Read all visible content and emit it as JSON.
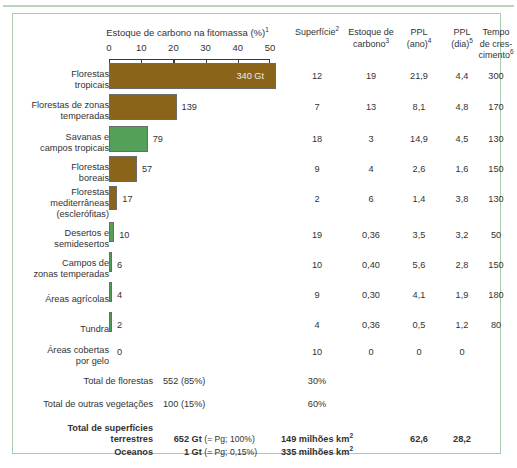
{
  "chart_data": {
    "type": "bar",
    "title": "Estoque de carbono na fitomassa (%)",
    "title_sup": "1",
    "xlabel": "Estoque de carbono na fitomassa (%)",
    "ylabel": "",
    "xlim": [
      0,
      50
    ],
    "ticks": [
      0,
      10,
      20,
      30,
      40,
      50
    ],
    "grid": false,
    "legend": false,
    "categories": [
      "Florestas tropicais",
      "Florestas de zonas temperadas",
      "Savanas e campos tropicais",
      "Florestas boreais",
      "Florestas mediterrâneas (esclerófitas)",
      "Desertos e semidesertos",
      "Campos de zonas temperadas",
      "Áreas agrícolas",
      "Tundra",
      "Áreas cobertas por gelo"
    ],
    "values": [
      52,
      21,
      12,
      8.7,
      2.6,
      1.5,
      0.9,
      0.6,
      0.3,
      0
    ],
    "value_labels": [
      "340 Gt",
      "139",
      "79",
      "57",
      "17",
      "10",
      "6",
      "4",
      "2",
      "0"
    ],
    "series": [
      {
        "name": "Estoque de carbono (Gt)",
        "values": [
          340,
          139,
          79,
          57,
          17,
          10,
          6,
          4,
          2,
          0
        ]
      },
      {
        "name": "Superfície (%)",
        "values": [
          12,
          7,
          18,
          9,
          2,
          19,
          10,
          9,
          4,
          10
        ]
      },
      {
        "name": "Estoque de carbono",
        "values": [
          "19",
          "13",
          "3",
          "4",
          "6",
          "0,36",
          "0,40",
          "0,30",
          "0,36",
          "0"
        ]
      },
      {
        "name": "PPL (ano)",
        "values": [
          "21,9",
          "8,1",
          "14,9",
          "2,6",
          "1,4",
          "3,5",
          "5,6",
          "4,1",
          "0,5",
          "0"
        ]
      },
      {
        "name": "PPL (dia)",
        "values": [
          "4,4",
          "4,8",
          "4,5",
          "1,6",
          "3,8",
          "3,2",
          "2,8",
          "1,9",
          "1,2",
          "0"
        ]
      },
      {
        "name": "Tempo de crescimento",
        "values": [
          "300",
          "170",
          "130",
          "150",
          "130",
          "50",
          "150",
          "180",
          "80",
          ""
        ]
      }
    ],
    "colors": {
      "forest": "#8a6419",
      "other": "#55a059",
      "frame": "#a9cbb0"
    }
  },
  "axis": {
    "title": "Estoque de carbono na fitomassa (%)",
    "title_sup": "1",
    "tick_labels": [
      "0",
      "10",
      "20",
      "30",
      "40",
      "50"
    ]
  },
  "columns": [
    {
      "id": "superficie",
      "line1": "Superfície",
      "sup1": "2",
      "line2": "",
      "line3": ""
    },
    {
      "id": "estoque-carbono",
      "line1": "Estoque de",
      "sup1": "",
      "line2": "carbono",
      "sup2": "3",
      "line3": ""
    },
    {
      "id": "ppl-ano",
      "line1": "PPL",
      "sup1": "",
      "line2": "(ano)",
      "sup2": "4",
      "line3": ""
    },
    {
      "id": "ppl-dia",
      "line1": "PPL",
      "sup1": "",
      "line2": "(dia)",
      "sup2": "5",
      "line3": ""
    },
    {
      "id": "tempo-crescimento",
      "line1": "Tempo",
      "sup1": "",
      "line2": "de cres-",
      "line3": "cimento",
      "sup3": "6"
    }
  ],
  "rows": [
    {
      "label_l1": "Florestas",
      "label_l2": "tropicais",
      "label_l3": "",
      "bar_value": 52,
      "bar_label": "340 Gt",
      "label_inside": true,
      "color": "brown",
      "superficie": "12",
      "estoque": "19",
      "ppl_ano": "21,9",
      "ppl_dia": "4,4",
      "tempo": "300"
    },
    {
      "label_l1": "Florestas de zonas",
      "label_l2": "temperadas",
      "label_l3": "",
      "bar_value": 21,
      "bar_label": "139",
      "label_inside": false,
      "color": "brown",
      "superficie": "7",
      "estoque": "13",
      "ppl_ano": "8,1",
      "ppl_dia": "4,8",
      "tempo": "170"
    },
    {
      "label_l1": "Savanas e",
      "label_l2": "campos tropicais",
      "label_l3": "",
      "bar_value": 12,
      "bar_label": "79",
      "label_inside": false,
      "color": "green",
      "superficie": "18",
      "estoque": "3",
      "ppl_ano": "14,9",
      "ppl_dia": "4,5",
      "tempo": "130"
    },
    {
      "label_l1": "Florestas",
      "label_l2": "boreais",
      "label_l3": "",
      "bar_value": 8.7,
      "bar_label": "57",
      "label_inside": false,
      "color": "brown",
      "superficie": "9",
      "estoque": "4",
      "ppl_ano": "2,6",
      "ppl_dia": "1,6",
      "tempo": "150"
    },
    {
      "label_l1": "Florestas",
      "label_l2": "mediterrâneas",
      "label_l3": "(esclerófitas)",
      "bar_value": 2.6,
      "bar_label": "17",
      "label_inside": false,
      "color": "brown",
      "superficie": "2",
      "estoque": "6",
      "ppl_ano": "1,4",
      "ppl_dia": "3,8",
      "tempo": "130"
    },
    {
      "label_l1": "Desertos e",
      "label_l2": "semidesertos",
      "label_l3": "",
      "bar_value": 1.6,
      "bar_label": "10",
      "label_inside": false,
      "color": "green",
      "superficie": "19",
      "estoque": "0,36",
      "ppl_ano": "3,5",
      "ppl_dia": "3,2",
      "tempo": "50"
    },
    {
      "label_l1": "Campos de",
      "label_l2": "zonas temperadas",
      "label_l3": "",
      "bar_value": 0.95,
      "bar_label": "6",
      "label_inside": false,
      "color": "green",
      "superficie": "10",
      "estoque": "0,40",
      "ppl_ano": "5,6",
      "ppl_dia": "2,8",
      "tempo": "150"
    },
    {
      "label_l1": "Áreas agrícolas",
      "label_l2": "",
      "label_l3": "",
      "bar_value": 0.75,
      "bar_label": "4",
      "label_inside": false,
      "color": "green",
      "superficie": "9",
      "estoque": "0,30",
      "ppl_ano": "4,1",
      "ppl_dia": "1,9",
      "tempo": "180"
    },
    {
      "label_l1": "Tundra",
      "label_l2": "",
      "label_l3": "",
      "bar_value": 0.6,
      "bar_label": "2",
      "label_inside": false,
      "color": "green",
      "superficie": "4",
      "estoque": "0,36",
      "ppl_ano": "0,5",
      "ppl_dia": "1,2",
      "tempo": "80"
    },
    {
      "label_l1": "Áreas cobertas",
      "label_l2": "por gelo",
      "label_l3": "",
      "bar_value": 0,
      "bar_label": "0",
      "label_inside": false,
      "color": "green",
      "superficie": "10",
      "estoque": "0",
      "ppl_ano": "0",
      "ppl_dia": "0",
      "tempo": ""
    }
  ],
  "totals": {
    "forests": {
      "label": "Total de florestas",
      "value": "552 (85%)",
      "superficie": "30%"
    },
    "other_veg": {
      "label": "Total de outras vegetações",
      "value": "100 (15%)",
      "superficie": "60%"
    },
    "land": {
      "label_l1": "Total de superfícies",
      "label_l2": "terrestres",
      "number": "652",
      "unit": "Gt",
      "paren": "(= Pg; 100%)",
      "superficie": "149 milhões km",
      "superficie_sup": "2",
      "ppl_ano": "62,6",
      "ppl_dia": "28,2"
    },
    "oceans": {
      "label_l1": "Oceanos",
      "number": "1",
      "unit": "Gt",
      "paren": "(= Pg; 0,15%)",
      "superficie": "335 milhões km",
      "superficie_sup": "2",
      "ppl_ano": "",
      "ppl_dia": ""
    }
  }
}
